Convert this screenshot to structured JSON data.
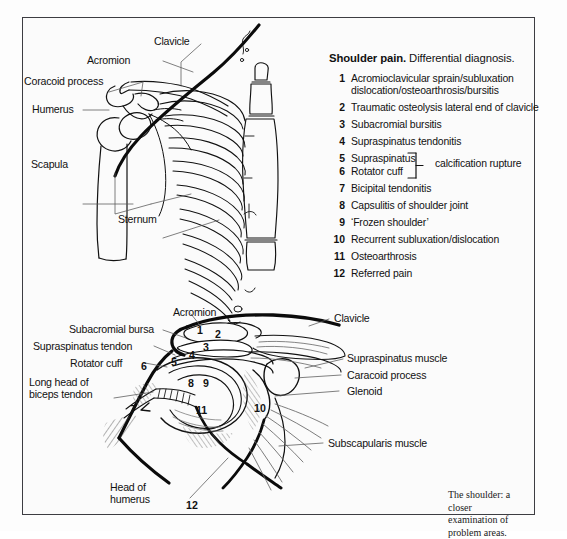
{
  "figure": {
    "caption": {
      "line1": "The shoulder: a closer",
      "line2": "examination of problem areas."
    }
  },
  "diagnosis_panel": {
    "title_strong": "Shoulder pain.",
    "title_rest": "Differential diagnosis.",
    "bracket_label": "calcification rupture",
    "items": [
      {
        "num": "1",
        "text": "Acromioclavicular sprain/subluxation",
        "text2": "dislocation/osteoarthrosis/bursitis"
      },
      {
        "num": "2",
        "text": "Traumatic osteolysis  lateral end of clavicle"
      },
      {
        "num": "3",
        "text": "Subacromial bursitis"
      },
      {
        "num": "4",
        "text": "Supraspinatus tendonitis"
      },
      {
        "num": "5",
        "text": "Supraspinatus"
      },
      {
        "num": "6",
        "text": "Rotator cuff"
      },
      {
        "num": "7",
        "text": "Bicipital tendonitis"
      },
      {
        "num": "8",
        "text": "Capsulitis of shoulder joint"
      },
      {
        "num": "9",
        "text": "‘Frozen shoulder’"
      },
      {
        "num": "10",
        "text": "Recurrent subluxation/dislocation"
      },
      {
        "num": "11",
        "text": "Osteoarthrosis"
      },
      {
        "num": "12",
        "text": "Referred pain"
      }
    ]
  },
  "upper_diagram": {
    "name": "shoulder-girdle-skeleton",
    "labels": [
      {
        "id": "clavicle",
        "text": "Clavicle"
      },
      {
        "id": "acromion",
        "text": "Acromion"
      },
      {
        "id": "coracoid-process",
        "text": "Coracoid process"
      },
      {
        "id": "humerus",
        "text": "Humerus"
      },
      {
        "id": "scapula",
        "text": "Scapula"
      },
      {
        "id": "sternum",
        "text": "Sternum"
      }
    ]
  },
  "lower_diagram": {
    "name": "shoulder-joint-cross-section",
    "labels_left": [
      {
        "id": "acromion",
        "text": "Acromion"
      },
      {
        "id": "subacromial-bursa",
        "text": "Subacromial bursa"
      },
      {
        "id": "supraspinatus-tendon",
        "text": "Supraspinatus tendon"
      },
      {
        "id": "rotator-cuff",
        "text": "Rotator cuff"
      },
      {
        "id": "long-head-biceps",
        "text": "Long head of",
        "text2": "biceps tendon"
      },
      {
        "id": "head-of-humerus",
        "text": "Head of",
        "text2": "humerus"
      }
    ],
    "labels_right": [
      {
        "id": "clavicle",
        "text": "Clavicle"
      },
      {
        "id": "supraspinatus-muscle",
        "text": "Supraspinatus muscle"
      },
      {
        "id": "caracoid-process",
        "text": "Caracoid process"
      },
      {
        "id": "glenoid",
        "text": "Glenoid"
      },
      {
        "id": "subscapularis-muscle",
        "text": "Subscapularis muscle"
      }
    ],
    "markers": [
      "1",
      "2",
      "3",
      "4",
      "5",
      "6",
      "7",
      "8",
      "9",
      "10",
      "11",
      "12"
    ]
  },
  "colors": {
    "ink": "#111111",
    "frame": "#3d3d42",
    "paper": "#fbfbfb"
  }
}
